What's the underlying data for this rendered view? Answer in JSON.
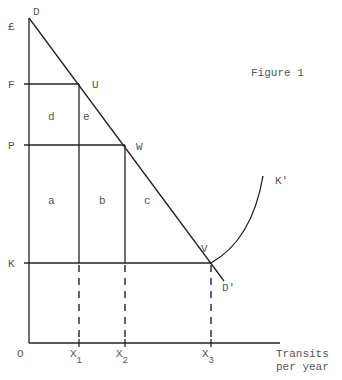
{
  "title": "Figure 1",
  "y_axis_unit": "£",
  "origin_label": "O",
  "x_axis_label_line1": "Transits",
  "x_axis_label_line2": "per year",
  "price_levels": {
    "F": "F",
    "P": "P",
    "K": "K"
  },
  "quantities": [
    {
      "base": "X",
      "sub": "1"
    },
    {
      "base": "X",
      "sub": "2"
    },
    {
      "base": "X",
      "sub": "3"
    }
  ],
  "points": {
    "D": "D",
    "U": "U",
    "W": "W",
    "V": "V",
    "D_prime": "D'",
    "K_prime": "K'"
  },
  "areas": {
    "a": "a",
    "b": "b",
    "c": "c",
    "d": "d",
    "e": "e"
  }
}
